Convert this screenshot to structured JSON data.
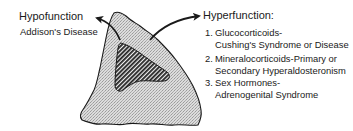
{
  "diagram": {
    "regions": [
      {
        "name": "cortex",
        "fill": "stippled light gray"
      },
      {
        "name": "medulla",
        "fill": "dark diagonal hatch"
      }
    ],
    "colors": {
      "stroke": "#1a1a1a",
      "cortex_fill": "#d9d9d9",
      "hatch": "#222222",
      "background": "#ffffff"
    }
  },
  "hypofunction": {
    "title": "Hypofunction",
    "condition": "Addison's Disease"
  },
  "hyperfunction": {
    "title": "Hyperfunction:",
    "items": [
      {
        "number": "1.",
        "line1": "Glucocorticoids-",
        "line2": "Cushing's Syndrome or Disease"
      },
      {
        "number": "2.",
        "line1": "Mineralocorticoids-Primary or",
        "line2": "Secondary Hyperaldosteronism"
      },
      {
        "number": "3.",
        "line1": "Sex Hormones-",
        "line2": "Adrenogenital Syndrome"
      }
    ]
  }
}
